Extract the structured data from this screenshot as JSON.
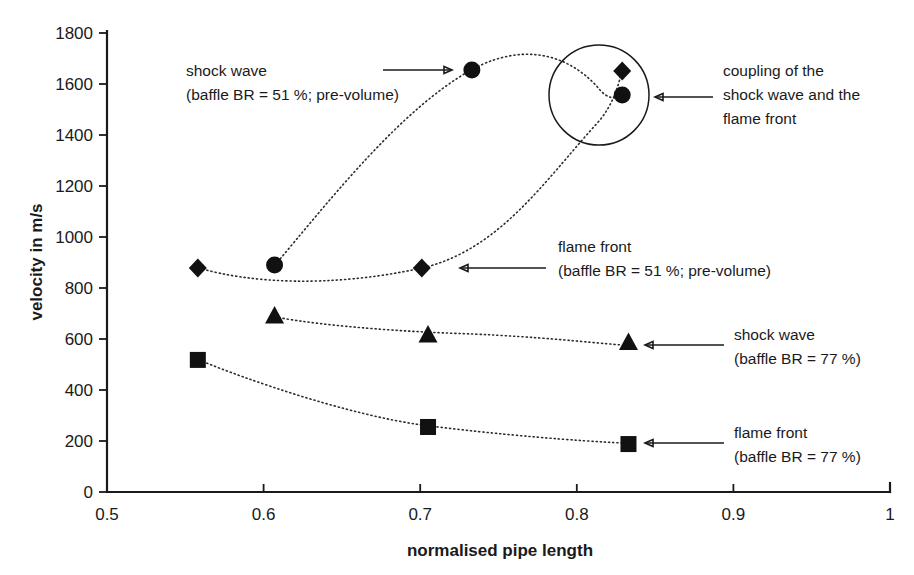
{
  "chart_data": {
    "type": "scatter",
    "title": "",
    "xlabel": "normalised pipe length",
    "ylabel": "velocity in m/s",
    "xlim": [
      0.5,
      1.0
    ],
    "ylim": [
      0,
      1800
    ],
    "xticks": [
      "0.5",
      "0.6",
      "0.7",
      "0.8",
      "0.9",
      "1"
    ],
    "xtick_values": [
      0.5,
      0.6,
      0.7,
      0.8,
      0.9,
      1.0
    ],
    "yticks": [
      "0",
      "200",
      "400",
      "600",
      "800",
      "1000",
      "1200",
      "1400",
      "1600",
      "1800"
    ],
    "ytick_values": [
      0,
      200,
      400,
      600,
      800,
      1000,
      1200,
      1400,
      1600,
      1800
    ],
    "grid": false,
    "legend_position": "inline-annotations",
    "series": [
      {
        "name": "shock wave (baffle BR = 51 %; pre-volume)",
        "marker": "circle",
        "x": [
          0.607,
          0.733,
          0.829
        ],
        "y": [
          890,
          1655,
          1557
        ]
      },
      {
        "name": "flame front (baffle BR = 51 %; pre-volume)",
        "marker": "diamond",
        "x": [
          0.558,
          0.701,
          0.829
        ],
        "y": [
          878,
          878,
          1651
        ]
      },
      {
        "name": "shock wave (baffle BR = 77 %)",
        "marker": "triangle",
        "x": [
          0.607,
          0.705,
          0.833
        ],
        "y": [
          690,
          616,
          586
        ]
      },
      {
        "name": "flame front (baffle BR = 77 %)",
        "marker": "square",
        "x": [
          0.558,
          0.705,
          0.833
        ],
        "y": [
          518,
          255,
          188
        ]
      }
    ]
  },
  "annotations": {
    "shock_wave_51": {
      "line1": "shock wave",
      "line2": "(baffle BR = 51 %; pre-volume)"
    },
    "flame_front_51": {
      "line1": "flame front",
      "line2": "(baffle BR = 51 %; pre-volume)"
    },
    "shock_wave_77": {
      "line1": "shock wave",
      "line2": "(baffle BR = 77 %)"
    },
    "flame_front_77": {
      "line1": "flame front",
      "line2": "(baffle BR = 77 %)"
    },
    "coupling": {
      "line1": "coupling of the",
      "line2": "shock wave and the",
      "line3": "flame front"
    }
  },
  "colors": {
    "axis": "#1a1a1a",
    "marker": "#111111",
    "series_line": "#2b2b2b",
    "background": "#ffffff"
  }
}
